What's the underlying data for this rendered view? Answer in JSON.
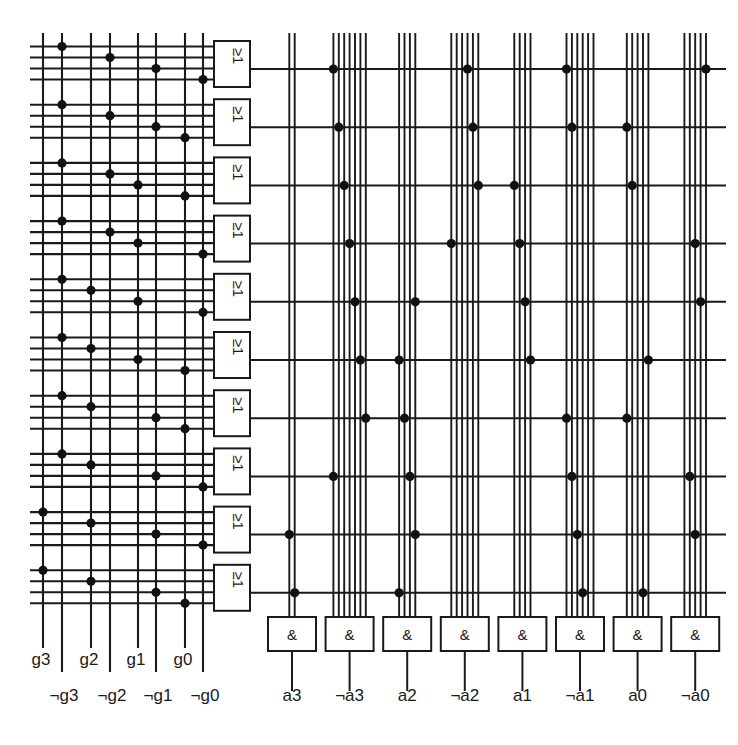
{
  "diagram": {
    "type": "pla-logic-array",
    "stroke_color": "#1a1a1a",
    "background_color": "#ffffff",
    "dot_color": "#111111"
  },
  "or_plane": {
    "gate_symbol": "≥1",
    "gate_count": 10,
    "gate_label_name": "or-gate",
    "inputs_per_gate": 4,
    "input_columns": [
      {
        "label": "g3",
        "x": 43
      },
      {
        "label": "¬g3",
        "x": 62
      },
      {
        "label": "g2",
        "x": 91
      },
      {
        "label": "¬g2",
        "x": 110
      },
      {
        "label": "g1",
        "x": 138
      },
      {
        "label": "¬g1",
        "x": 156
      },
      {
        "label": "g0",
        "x": 185
      },
      {
        "label": "¬g0",
        "x": 203
      }
    ],
    "bottom_labels_row1": [
      "g3",
      "g2",
      "g1",
      "g0"
    ],
    "bottom_labels_row2": [
      "¬g3",
      "¬g2",
      "¬g1",
      "¬g0"
    ],
    "connections": [
      [
        1,
        3,
        5,
        7
      ],
      [
        1,
        3,
        5,
        6
      ],
      [
        1,
        3,
        4,
        6
      ],
      [
        1,
        3,
        4,
        7
      ],
      [
        1,
        2,
        4,
        7
      ],
      [
        1,
        2,
        4,
        6
      ],
      [
        1,
        2,
        5,
        6
      ],
      [
        1,
        2,
        5,
        7
      ],
      [
        0,
        2,
        5,
        7
      ],
      [
        0,
        2,
        5,
        6
      ]
    ]
  },
  "and_plane": {
    "gate_symbol": "&",
    "gate_count": 8,
    "gate_label_name": "and-gate",
    "outputs": [
      {
        "label": "a3",
        "lines": 2
      },
      {
        "label": "¬a3",
        "lines": 7
      },
      {
        "label": "a2",
        "lines": 4
      },
      {
        "label": "¬a2",
        "lines": 6
      },
      {
        "label": "a1",
        "lines": 4
      },
      {
        "label": "¬a1",
        "lines": 6
      },
      {
        "label": "a0",
        "lines": 5
      },
      {
        "label": "¬a0",
        "lines": 5
      }
    ],
    "bottom_labels": [
      "a3",
      "¬a3",
      "a2",
      "¬a2",
      "a1",
      "¬a1",
      "a0",
      "¬a0"
    ],
    "term_rows": 10,
    "connections": [
      [
        1,
        3,
        5,
        7
      ],
      [
        1,
        3,
        5,
        6
      ],
      [
        1,
        3,
        4,
        6
      ],
      [
        1,
        3,
        4,
        7
      ],
      [
        1,
        2,
        4,
        7
      ],
      [
        1,
        2,
        4,
        6
      ],
      [
        1,
        2,
        5,
        6
      ],
      [
        1,
        2,
        5,
        7
      ],
      [
        0,
        2,
        5,
        7
      ],
      [
        0,
        2,
        5,
        6
      ]
    ]
  }
}
